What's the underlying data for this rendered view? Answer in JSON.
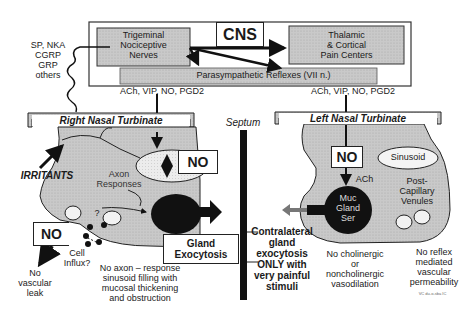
{
  "cns": {
    "title": "CNS",
    "trigeminal": [
      "Trigeminal",
      "Nociceptive",
      "Nerves"
    ],
    "thalamic": [
      "Thalamic",
      "& Cortical",
      "Pain Centers"
    ],
    "parasympathetic": "Parasympathetic Reflexes (VII n.)",
    "left_mediators": "ACh, VIP, NO, PGD2",
    "right_mediators": "ACh, VIP, NO, PGD2"
  },
  "neuropeptides": [
    "SP, NKA",
    "CGRP",
    "GRP",
    "others"
  ],
  "septum": "Septum",
  "right": {
    "title": "Right Nasal Turbinate",
    "irritants": "IRRITANTS",
    "axon": [
      "Axon",
      "Responses"
    ],
    "no_box": "NO",
    "no_box2": "NO",
    "question": "?",
    "cell_influx": [
      "Cell",
      "Influx?"
    ],
    "no_leak": [
      "No",
      "vascular",
      "leak"
    ],
    "gland_exocytosis": [
      "Gland",
      "Exocytosis"
    ],
    "no_axon_text": [
      "No axon – response",
      "sinusoid filling with",
      "mucosal thickening",
      "and obstruction"
    ]
  },
  "left": {
    "title": "Left Nasal Turbinate",
    "no_box": "NO",
    "sinusoid": "Sinusoid",
    "ach": "ACh",
    "post_capillary": [
      "Post-",
      "Capillary",
      "Venules"
    ],
    "gland_labels": [
      "Muc",
      "Gland",
      "Ser"
    ],
    "contralateral": [
      "Contralateral",
      "gland",
      "exocytosis",
      "ONLY with",
      "very painful",
      "stimuli"
    ],
    "no_cholinergic": [
      "No cholinergic",
      "or",
      "noncholinergic",
      "vasodilation"
    ],
    "no_reflex": [
      "No reflex",
      "mediated",
      "vascular",
      "permeability"
    ],
    "credit": "VC  du-o-sba IC"
  },
  "colors": {
    "tissue": "#c8c8c8",
    "box_fill": "#bdbdbd",
    "dark": "#111111"
  }
}
